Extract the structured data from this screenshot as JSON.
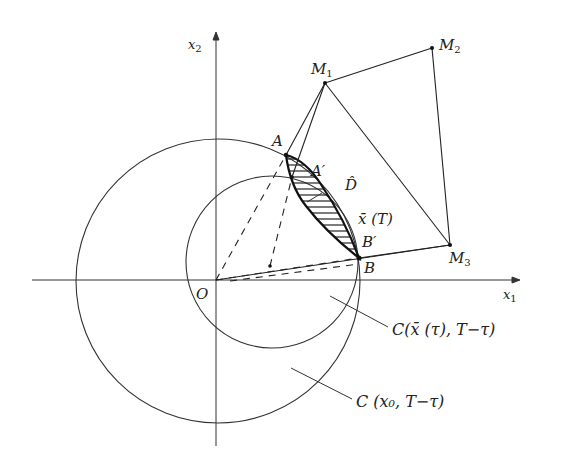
{
  "figure": {
    "colors": {
      "ink": "#222222",
      "background": "#ffffff"
    },
    "axes": {
      "x_label": "x",
      "x_label_sub": "1",
      "y_label": "x",
      "y_label_sub": "2",
      "origin_label": "O"
    },
    "points": {
      "A": "A",
      "A_prime": "A′",
      "B": "B",
      "B_prime": "B′",
      "M1": "M",
      "M1_sub": "1",
      "M2": "M",
      "M2_sub": "2",
      "M3": "M",
      "M3_sub": "3"
    },
    "region_label": "D̂",
    "trajectory_label": "x̄ (T)",
    "circle_small_label": "C(x̄ (τ), T−τ)",
    "circle_large_label": "C (x₀, T−τ)"
  }
}
